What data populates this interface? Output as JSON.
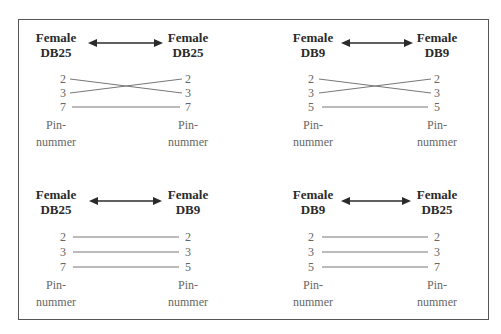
{
  "diagram": {
    "connector_prefix": "Female",
    "pin_caption_line1": "Pin-",
    "pin_caption_line2": "nummer",
    "panels": [
      {
        "id": "db25-db25",
        "left": {
          "gender": "Female",
          "type": "DB25"
        },
        "right": {
          "gender": "Female",
          "type": "DB25"
        },
        "pins": [
          {
            "from": "2",
            "to": "3",
            "left_label": "2",
            "right_label": "2"
          },
          {
            "from": "3",
            "to": "2",
            "left_label": "3",
            "right_label": "3"
          },
          {
            "from": "7",
            "to": "7",
            "left_label": "7",
            "right_label": "7"
          }
        ],
        "crossed": true
      },
      {
        "id": "db9-db9",
        "left": {
          "gender": "Female",
          "type": "DB9"
        },
        "right": {
          "gender": "Female",
          "type": "DB9"
        },
        "pins": [
          {
            "from": "2",
            "to": "3",
            "left_label": "2",
            "right_label": "2"
          },
          {
            "from": "3",
            "to": "2",
            "left_label": "3",
            "right_label": "3"
          },
          {
            "from": "5",
            "to": "5",
            "left_label": "5",
            "right_label": "5"
          }
        ],
        "crossed": true
      },
      {
        "id": "db25-db9",
        "left": {
          "gender": "Female",
          "type": "DB25"
        },
        "right": {
          "gender": "Female",
          "type": "DB9"
        },
        "pins": [
          {
            "from": "2",
            "to": "2",
            "left_label": "2",
            "right_label": "2"
          },
          {
            "from": "3",
            "to": "3",
            "left_label": "3",
            "right_label": "3"
          },
          {
            "from": "7",
            "to": "5",
            "left_label": "7",
            "right_label": "5"
          }
        ],
        "crossed": false
      },
      {
        "id": "db9-db25",
        "left": {
          "gender": "Female",
          "type": "DB9"
        },
        "right": {
          "gender": "Female",
          "type": "DB25"
        },
        "pins": [
          {
            "from": "2",
            "to": "2",
            "left_label": "2",
            "right_label": "2"
          },
          {
            "from": "3",
            "to": "3",
            "left_label": "3",
            "right_label": "3"
          },
          {
            "from": "5",
            "to": "7",
            "left_label": "5",
            "right_label": "7"
          }
        ],
        "crossed": false
      }
    ],
    "colors": {
      "frame": "#555555",
      "label": "#2b2b2b",
      "pin_text": "#666666",
      "wire": "#777777",
      "arrow": "#2b2b2b"
    }
  }
}
